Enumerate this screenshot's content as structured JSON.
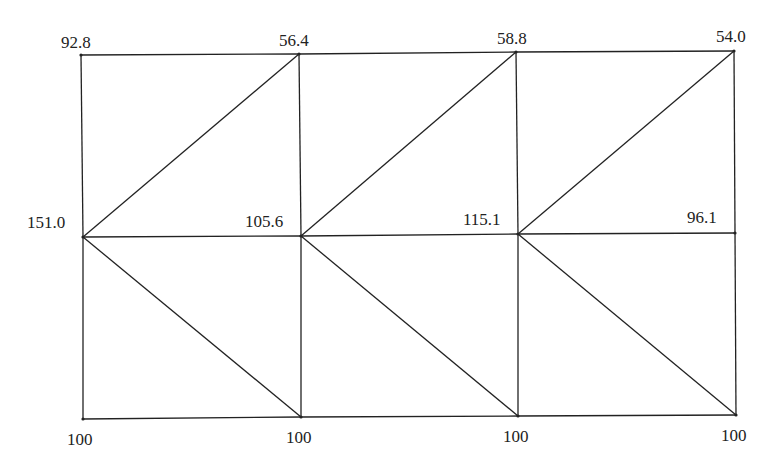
{
  "diagram": {
    "type": "triangular-mesh",
    "rows": 3,
    "cols": 4,
    "line_color": "#222222",
    "nodes": [
      {
        "id": "n00",
        "x": 81,
        "y": 55,
        "value": "92.8"
      },
      {
        "id": "n01",
        "x": 299,
        "y": 54,
        "value": "56.4"
      },
      {
        "id": "n02",
        "x": 516,
        "y": 52,
        "value": "58.8"
      },
      {
        "id": "n03",
        "x": 734,
        "y": 51,
        "value": "54.0"
      },
      {
        "id": "n10",
        "x": 83,
        "y": 237,
        "value": "151.0"
      },
      {
        "id": "n11",
        "x": 301,
        "y": 236,
        "value": "105.6"
      },
      {
        "id": "n12",
        "x": 518,
        "y": 234,
        "value": "115.1"
      },
      {
        "id": "n13",
        "x": 735,
        "y": 233,
        "value": "96.1"
      },
      {
        "id": "n20",
        "x": 83,
        "y": 419,
        "value": "100"
      },
      {
        "id": "n21",
        "x": 301,
        "y": 417,
        "value": "100"
      },
      {
        "id": "n22",
        "x": 518,
        "y": 416,
        "value": "100"
      },
      {
        "id": "n23",
        "x": 736,
        "y": 415,
        "value": "100"
      }
    ],
    "edges": [
      [
        "n00",
        "n01"
      ],
      [
        "n01",
        "n02"
      ],
      [
        "n02",
        "n03"
      ],
      [
        "n10",
        "n11"
      ],
      [
        "n11",
        "n12"
      ],
      [
        "n12",
        "n13"
      ],
      [
        "n20",
        "n21"
      ],
      [
        "n21",
        "n22"
      ],
      [
        "n22",
        "n23"
      ],
      [
        "n00",
        "n10"
      ],
      [
        "n10",
        "n20"
      ],
      [
        "n01",
        "n11"
      ],
      [
        "n11",
        "n21"
      ],
      [
        "n02",
        "n12"
      ],
      [
        "n12",
        "n22"
      ],
      [
        "n03",
        "n13"
      ],
      [
        "n13",
        "n23"
      ],
      [
        "n10",
        "n01"
      ],
      [
        "n11",
        "n02"
      ],
      [
        "n12",
        "n03"
      ],
      [
        "n10",
        "n21"
      ],
      [
        "n11",
        "n22"
      ],
      [
        "n12",
        "n23"
      ]
    ],
    "labels": {
      "top": [
        "92.8",
        "56.4",
        "58.8",
        "54.0"
      ],
      "middle": [
        "151.0",
        "105.6",
        "115.1",
        "96.1"
      ],
      "bottom": [
        "100",
        "100",
        "100",
        "100"
      ]
    }
  }
}
